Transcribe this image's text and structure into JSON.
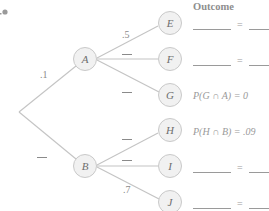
{
  "header": {
    "outcome_label": "Outcome"
  },
  "nodes": {
    "A": "A",
    "B": "B",
    "E": "E",
    "F": "F",
    "G": "G",
    "H": "H",
    "I": "I",
    "J": "J"
  },
  "branches": {
    "root_to_A": ".1",
    "root_to_B": "",
    "A_to_E": ".5",
    "A_to_F": "",
    "A_to_G": "",
    "B_to_H": "",
    "B_to_I": "",
    "B_to_J": ".7"
  },
  "outcomes": {
    "E": {
      "expr": "",
      "equals": "=",
      "value": ""
    },
    "F": {
      "expr": "",
      "equals": "=",
      "value": ""
    },
    "G": {
      "expr": "P(G ∩ A) = 0"
    },
    "H": {
      "expr": "P(H ∩ B) = .09"
    },
    "I": {
      "expr": "",
      "equals": "=",
      "value": ""
    },
    "J": {
      "expr": "",
      "equals": "=",
      "value": ""
    }
  },
  "colors": {
    "line": "#c4c4c4",
    "node_fill": "#f1f1f1",
    "node_border": "#c9c9c9",
    "text": "#8a8a8a"
  }
}
